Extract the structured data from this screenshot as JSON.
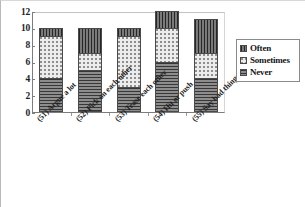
{
  "chart_data": {
    "type": "bar",
    "subtype": "stacked-bar",
    "title": "",
    "xlabel": "",
    "ylabel": "",
    "ylim": [
      0,
      12
    ],
    "yticks": [
      0,
      2,
      4,
      6,
      8,
      10,
      12
    ],
    "grid": false,
    "legend_position": "right",
    "categories": [
      "(51) Argue a lot",
      "(52) Pick on each other",
      "(53) Tease each other",
      "(54) Hit or push",
      "(55) Say bad things"
    ],
    "series": [
      {
        "name": "Never",
        "pattern": "horizontal-lines",
        "color": "#8d8d8d",
        "values": [
          4,
          5,
          3,
          6,
          4
        ]
      },
      {
        "name": "Sometimes",
        "pattern": "dots",
        "color": "#ececec",
        "values": [
          5,
          2,
          6,
          4,
          3
        ]
      },
      {
        "name": "Often",
        "pattern": "vertical-lines",
        "color": "#7a7a7a",
        "values": [
          1,
          3,
          1,
          2,
          4
        ]
      }
    ],
    "totals": [
      10,
      10,
      10,
      12,
      11
    ]
  },
  "legend": {
    "items": [
      {
        "label": "Often"
      },
      {
        "label": "Sometimes"
      },
      {
        "label": "Never"
      }
    ]
  },
  "axis": {
    "y_tick_labels": [
      "12",
      "10",
      "8",
      "6",
      "4",
      "2",
      "0"
    ]
  }
}
